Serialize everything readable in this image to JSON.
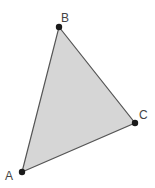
{
  "diagram": {
    "type": "triangle",
    "fill_color": "#d6d6d6",
    "stroke_color": "#555555",
    "point_color": "#1a1a1a",
    "vertices": [
      {
        "label": "A",
        "x": 22,
        "y": 172,
        "label_x": 5,
        "label_y": 180
      },
      {
        "label": "B",
        "x": 59,
        "y": 27,
        "label_x": 61,
        "label_y": 22
      },
      {
        "label": "C",
        "x": 135,
        "y": 123,
        "label_x": 139,
        "label_y": 119
      }
    ]
  }
}
